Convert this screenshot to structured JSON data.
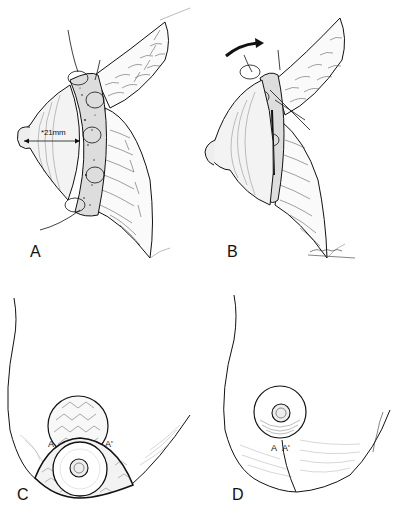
{
  "figure": {
    "background": "#ffffff",
    "ink_color": "#111111",
    "panels": [
      {
        "id": "A",
        "label": "A",
        "description": "Lateral view: areola with de-epithelialized dermal ring secured by sutures, flaps retracted",
        "measurement": "*21mm"
      },
      {
        "id": "B",
        "label": "B",
        "description": "Lateral view: areola rotated upward with curved arrow indicating rotation",
        "rotation_arrow": "rotate-arrow"
      },
      {
        "id": "C",
        "label": "C",
        "description": "Frontal view: areola positioned with tissue flap above, marked points",
        "marks": [
          "A",
          "A'"
        ]
      },
      {
        "id": "D",
        "label": "D",
        "description": "Frontal view: final closure with vertical scar below areola",
        "marks": [
          "A",
          "A'"
        ]
      }
    ]
  }
}
